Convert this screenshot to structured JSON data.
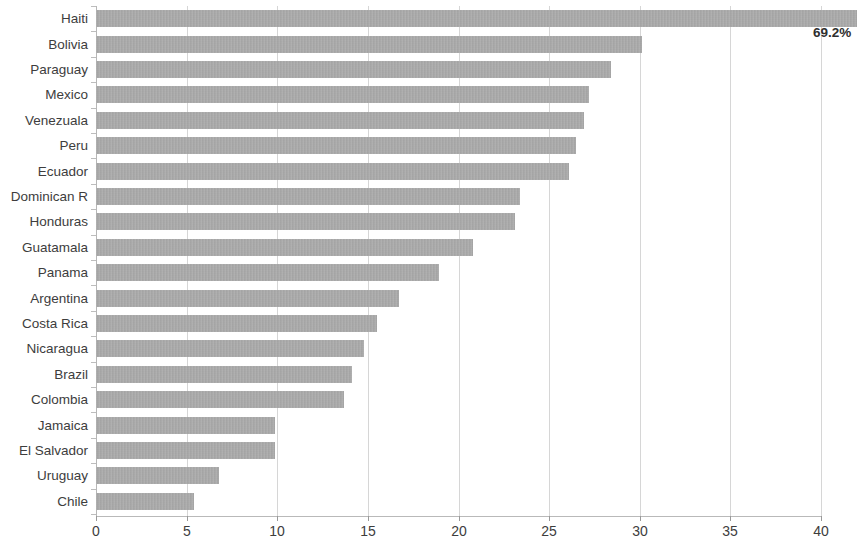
{
  "chart_data": {
    "type": "bar",
    "orientation": "horizontal",
    "title": "",
    "subtitle": "",
    "xlabel": "",
    "ylabel": "",
    "xlim": [
      0,
      40
    ],
    "xticks": [
      0,
      5,
      10,
      15,
      20,
      25,
      30,
      35,
      40
    ],
    "xtick_labels": [
      "0",
      "5",
      "10",
      "15",
      "20",
      "25",
      "30",
      "35",
      "40"
    ],
    "grid": true,
    "grid_axis": "x",
    "legend": false,
    "legend_position": "none",
    "bar_color": "#a9a9a9",
    "gridline_color": "#d6d6d6",
    "axis_color": "#b7b7b7",
    "categories": [
      "Haiti",
      "Bolivia",
      "Paraguay",
      "Mexico",
      "Venezuala",
      "Peru",
      "Ecuador",
      "Dominican R",
      "Honduras",
      "Guatamala",
      "Panama",
      "Argentina",
      "Costa Rica",
      "Nicaragua",
      "Brazil",
      "Colombia",
      "Jamaica",
      "El Salvador",
      "Uruguay",
      "Chile"
    ],
    "values": [
      69.2,
      30.1,
      28.4,
      27.2,
      26.9,
      26.5,
      26.1,
      23.4,
      23.1,
      20.8,
      18.9,
      16.7,
      15.5,
      14.8,
      14.1,
      13.7,
      9.9,
      9.9,
      6.8,
      5.4
    ],
    "clipped_bars": [
      {
        "category": "Haiti",
        "value": 69.2,
        "note": "bar extends beyond axis maximum and is clipped at plot edge"
      }
    ],
    "annotations": [
      {
        "text": "69.2%",
        "category": "Haiti",
        "x": 42.2,
        "placement": "below-right-of-bar-end"
      }
    ]
  }
}
